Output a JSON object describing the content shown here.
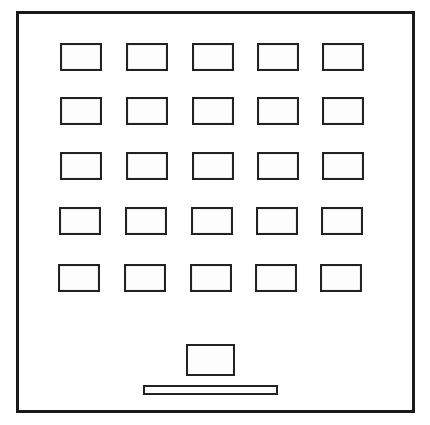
{
  "game": {
    "type": "breakout-style board",
    "colors": {
      "outline": "#1a1a1a",
      "fill": "#ffffff"
    },
    "grid": {
      "rows": 5,
      "columns": 5,
      "brick_count": 25,
      "column_x": [
        60,
        126,
        192,
        257,
        322
      ],
      "row_y": [
        43,
        97,
        152,
        207,
        264
      ]
    },
    "ball_block": {
      "x": 186,
      "y": 344,
      "w": 49,
      "h": 31
    },
    "paddle": {
      "x": 143,
      "y": 385,
      "w": 135,
      "h": 10
    }
  }
}
